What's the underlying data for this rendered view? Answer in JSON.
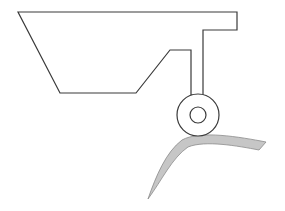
{
  "illustration": {
    "subject": "security-camera",
    "caption": "Security camera line drawing",
    "colors": {
      "background": "#ffffff",
      "stroke": "#3a3a3a",
      "bracket_fill": "#c6c6c6",
      "bracket_stroke": "#8a8a8a"
    },
    "parts": {
      "body": {
        "points": [
          [
            18,
            12
          ],
          [
            237,
            12
          ],
          [
            237,
            30
          ],
          [
            203,
            30
          ],
          [
            203,
            95
          ],
          [
            191,
            95
          ],
          [
            191,
            50
          ],
          [
            170,
            50
          ],
          [
            136,
            93
          ],
          [
            60,
            93
          ]
        ]
      },
      "pivot": {
        "cx": 198,
        "cy": 115,
        "outer_r": 21,
        "inner_r": 8
      },
      "mount_bracket": {
        "path": "M148,199 C156,176 166,152 182,140 C200,130 240,137 266,142 L259,150 C238,146 205,140 188,147 C172,158 162,180 148,199 Z"
      }
    }
  }
}
